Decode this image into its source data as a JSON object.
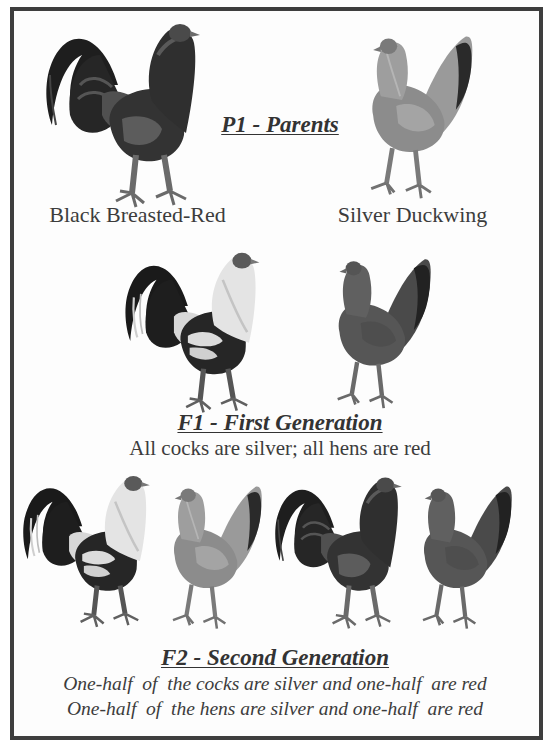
{
  "diagram": {
    "border_color": "#3e3e3e",
    "sections": [
      {
        "id": "p1",
        "title": "P1 - Parents",
        "birds": [
          {
            "sex": "cock",
            "variety": "Black Breasted-Red",
            "color": "red"
          },
          {
            "sex": "hen",
            "variety": "Silver Duckwing",
            "color": "silver"
          }
        ],
        "labels": [
          "Black Breasted-Red",
          "Silver Duckwing"
        ]
      },
      {
        "id": "f1",
        "title": "F1 - First Generation",
        "birds": [
          {
            "sex": "cock",
            "color": "silver"
          },
          {
            "sex": "hen",
            "color": "red"
          }
        ],
        "caption": "All cocks are silver; all hens are red"
      },
      {
        "id": "f2",
        "title": "F2 - Second Generation",
        "birds": [
          {
            "sex": "cock",
            "color": "silver"
          },
          {
            "sex": "hen",
            "color": "silver"
          },
          {
            "sex": "cock",
            "color": "red"
          },
          {
            "sex": "hen",
            "color": "red"
          }
        ],
        "captions": [
          "One-half  of  the cocks are silver and one-half  are red",
          "One-half  of  the hens are silver and one-half  are red"
        ]
      }
    ],
    "palette": {
      "red_body": "#3b3b3b",
      "red_hackle": "#555555",
      "silver_body": "#8a8a8a",
      "silver_hackle": "#dcdcdc",
      "tail_black": "#1e1e1e",
      "hen_red": "#585858",
      "hen_silver": "#8d8d8d",
      "legs": "#6a6a6a"
    }
  }
}
